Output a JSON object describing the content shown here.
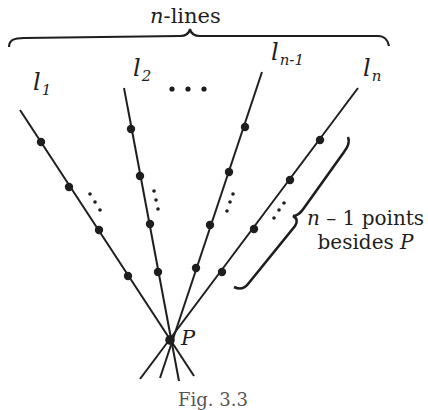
{
  "figure": {
    "title_var": "n",
    "title_rest": "-lines",
    "lines": [
      {
        "base": "l",
        "sub": "1"
      },
      {
        "base": "l",
        "sub": "2"
      },
      {
        "base": "l",
        "sub": "n-1"
      },
      {
        "base": "l",
        "sub": "n"
      }
    ],
    "between_dots": "• • •",
    "point_label": "P",
    "bracket_note_line1_var": "n",
    "bracket_note_line1_rest": " – 1 points",
    "bracket_note_line2_text": "besides ",
    "bracket_note_line2_var": "P",
    "caption": "Fig. 3.3",
    "colors": {
      "ink": "#1e1e1e",
      "background": "#ffffff"
    }
  }
}
